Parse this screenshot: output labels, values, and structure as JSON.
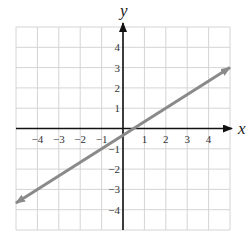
{
  "chart_data": {
    "type": "line",
    "title": "",
    "xlabel": "x",
    "ylabel": "y",
    "xlim": [
      -5,
      5
    ],
    "ylim": [
      -5,
      5
    ],
    "grid": true,
    "x_ticks": [
      -4,
      -3,
      -2,
      -1,
      1,
      2,
      3,
      4
    ],
    "y_ticks": [
      -4,
      -3,
      -2,
      -1,
      1,
      2,
      3,
      4
    ],
    "x_tick_labels": [
      "−4",
      "−3",
      "−2",
      "−1",
      "1",
      "2",
      "3",
      "4"
    ],
    "y_tick_labels": [
      "−4",
      "−3",
      "−2",
      "−1",
      "1",
      "2",
      "3",
      "4"
    ],
    "series": [
      {
        "name": "line",
        "equation": "y = (2/3)x - 1/3",
        "x": [
          -5,
          5
        ],
        "y": [
          -3.67,
          3.0
        ],
        "arrows": "both",
        "color": "#8a8a8a"
      }
    ],
    "legend": null
  },
  "colors": {
    "grid": "#d4d4d4",
    "axis": "#111111",
    "line": "#8a8a8a"
  }
}
